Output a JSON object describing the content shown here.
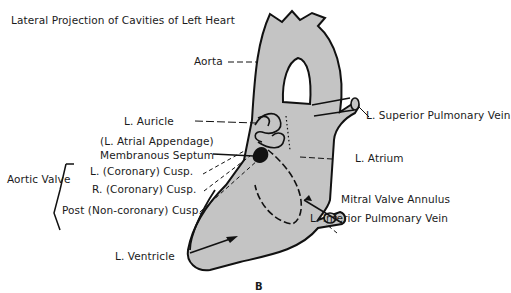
{
  "title": "Lateral Projection of Cavities of Left Heart",
  "figure_letter": "B",
  "colors": {
    "fill": "#c4c4c4",
    "stroke": "#111111",
    "background": "#ffffff"
  },
  "labels": {
    "aorta": "Aorta",
    "l_auricle": "L. Auricle",
    "l_atrial_appendage": "(L. Atrial Appendage)",
    "membranous_septum": "Membranous Septum",
    "l_coronary_cusp": "L. (Coronary) Cusp.",
    "r_coronary_cusp": "R. (Coronary) Cusp.",
    "post_noncoronary_cusp": "Post (Non-coronary) Cusp.",
    "aortic_valve": "Aortic Valve",
    "l_ventricle": "L. Ventricle",
    "l_superior_pulmonary_vein": "L. Superior Pulmonary Vein",
    "l_atrium": "L. Atrium",
    "mitral_valve_annulus": "Mitral Valve Annulus",
    "l_inferior_pulmonary_vein": "L. Inferior Pulmonary Vein"
  }
}
